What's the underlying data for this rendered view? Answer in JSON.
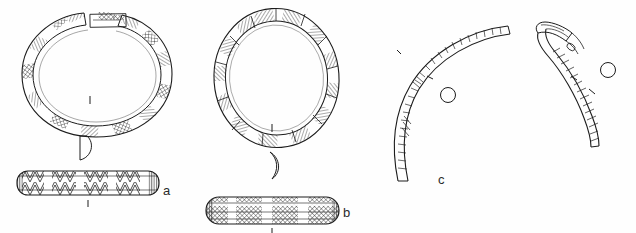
{
  "plate": {
    "type": "archaeological-artefact-line-drawing",
    "background_color": "#ffffff",
    "ink_color": "#1c1c1c",
    "width": 636,
    "height": 233,
    "description": "Ink line drawing plate of three metal ring/bracelet artefacts with profile and cross-section views"
  },
  "figures": [
    {
      "id": "a",
      "label": "a",
      "label_position": {
        "x": 163,
        "y": 183
      },
      "name": "open-penannular-bracelet",
      "views": [
        {
          "view": "plan",
          "shape": "open ring with gap at top",
          "outline": "oval",
          "bounds": {
            "x": 18,
            "y": 10,
            "width": 160,
            "height": 128
          },
          "decoration": "alternating hatched and cross-hatched rectangular panels around the band",
          "panel_count": 16,
          "gap_detail": "detached rectangular terminal fragment drawn in the gap"
        },
        {
          "view": "cross-section",
          "shape": "D-shaped",
          "position": {
            "x": 85,
            "y": 148
          }
        },
        {
          "view": "band-elevation",
          "shape": "rounded rectangular bar",
          "bounds": {
            "x": 16,
            "y": 170,
            "width": 144,
            "height": 26
          },
          "decoration": "chevron and zigzag banding in alternating blocks"
        }
      ],
      "scale_tick": {
        "x": 90,
        "y": 100
      }
    },
    {
      "id": "b",
      "label": "b",
      "label_position": {
        "x": 343,
        "y": 205
      },
      "name": "closed-oval-ring",
      "views": [
        {
          "view": "plan",
          "shape": "closed ring",
          "outline": "oval",
          "bounds": {
            "x": 212,
            "y": 8,
            "width": 128,
            "height": 140
          },
          "decoration": "alternating diagonally hatched segments separated by plain blocks",
          "panel_count": 18
        },
        {
          "view": "cross-section",
          "shape": "crescent",
          "position": {
            "x": 274,
            "y": 163
          }
        },
        {
          "view": "band-elevation",
          "shape": "rounded rectangular bar",
          "bounds": {
            "x": 205,
            "y": 196,
            "width": 135,
            "height": 29
          },
          "decoration": "cross-hatched bands interrupted by plain vertical blocks"
        }
      ],
      "scale_tick": {
        "x": 272,
        "y": 128
      }
    },
    {
      "id": "c",
      "label": "c",
      "label_position": {
        "x": 438,
        "y": 172
      },
      "name": "curved-rod-fragments",
      "fragment_count": 2,
      "views": [
        {
          "view": "fragment-left",
          "shape": "long curved rod, C-shaped arc",
          "bounds": {
            "x": 395,
            "y": 16,
            "width": 120,
            "height": 168
          },
          "decoration": "fine transverse nicks and oblique hatching along the shaft"
        },
        {
          "view": "fragment-right",
          "shape": "shorter curved rod with worked terminal",
          "bounds": {
            "x": 535,
            "y": 28,
            "width": 70,
            "height": 120
          },
          "decoration": "oblique hatching, flattened terminal at upper end"
        },
        {
          "view": "cross-section",
          "shape": "circle",
          "position": {
            "x": 448,
            "y": 95
          }
        },
        {
          "view": "cross-section",
          "shape": "circle",
          "position": {
            "x": 608,
            "y": 70
          }
        }
      ],
      "tick_marks": [
        {
          "x": 399,
          "y": 52
        },
        {
          "x": 430,
          "y": 78
        },
        {
          "x": 574,
          "y": 78
        },
        {
          "x": 592,
          "y": 92
        }
      ]
    }
  ]
}
